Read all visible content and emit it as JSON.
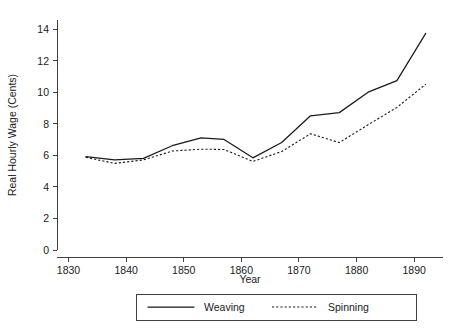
{
  "chart_data": {
    "type": "line",
    "title": "",
    "xlabel": "Year",
    "ylabel": "Real Hourly Wage (Cents)",
    "xlim": [
      1828,
      1895
    ],
    "ylim": [
      0,
      14.6
    ],
    "xticks": [
      1830,
      1840,
      1850,
      1860,
      1870,
      1880,
      1890
    ],
    "xticklabels": [
      "1830",
      "1840",
      "1850",
      "1860",
      "1870",
      "1880",
      "1890"
    ],
    "yticks": [
      0,
      2,
      4,
      6,
      8,
      10,
      12,
      14
    ],
    "yticklabels": [
      "0",
      "2",
      "4",
      "6",
      "8",
      "10",
      "12",
      "14"
    ],
    "grid": false,
    "legend_position": "below-center",
    "series": [
      {
        "name": "Weaving",
        "style": "solid",
        "color": "#1a1a1a",
        "x": [
          1833,
          1838,
          1843,
          1848,
          1853,
          1857,
          1862,
          1867,
          1872,
          1877,
          1882,
          1887,
          1892
        ],
        "values": [
          5.92,
          5.72,
          5.82,
          6.62,
          7.12,
          7.02,
          5.85,
          6.82,
          8.52,
          8.72,
          10.02,
          10.75,
          13.75
        ]
      },
      {
        "name": "Spinning",
        "style": "dotted",
        "color": "#1a1a1a",
        "x": [
          1833,
          1838,
          1843,
          1848,
          1853,
          1857,
          1862,
          1867,
          1872,
          1877,
          1882,
          1887,
          1892
        ],
        "values": [
          5.88,
          5.5,
          5.72,
          6.28,
          6.4,
          6.38,
          5.62,
          6.25,
          7.38,
          6.82,
          7.95,
          9.05,
          10.52
        ]
      }
    ]
  },
  "axis": {
    "y_label": "Real Hourly Wage (Cents)",
    "x_label": "Year"
  },
  "legend": {
    "items": [
      {
        "label": "Weaving",
        "style": "solid"
      },
      {
        "label": "Spinning",
        "style": "dotted"
      }
    ]
  }
}
